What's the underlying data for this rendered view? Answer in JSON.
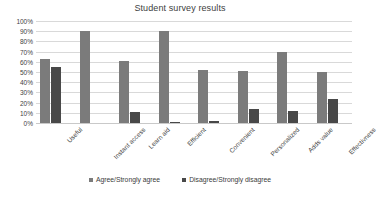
{
  "chart_data": {
    "type": "bar",
    "title": "Student survey results",
    "xlabel": "",
    "ylabel": "",
    "ylim": [
      0,
      100
    ],
    "ytick_labels": [
      "100%",
      "90%",
      "80%",
      "70%",
      "60%",
      "50%",
      "40%",
      "30%",
      "20%",
      "10%",
      "0%"
    ],
    "ytick_values": [
      100,
      90,
      80,
      70,
      60,
      50,
      40,
      30,
      20,
      10,
      0
    ],
    "grid": true,
    "legend_position": "bottom",
    "categories": [
      "Useful",
      "Instant access",
      "Learn aid",
      "Efficient",
      "Convenient",
      "Personalized",
      "Adds value",
      "Effectivness"
    ],
    "series": [
      {
        "name": "Agree/Strongly agree",
        "color": "#7b7b7b",
        "values": [
          63,
          90,
          61,
          90,
          52,
          51,
          70,
          50
        ]
      },
      {
        "name": "Disagree/Strongly disagree",
        "color": "#484848",
        "values": [
          55,
          0,
          11,
          1,
          2,
          14,
          12,
          24
        ]
      }
    ]
  }
}
